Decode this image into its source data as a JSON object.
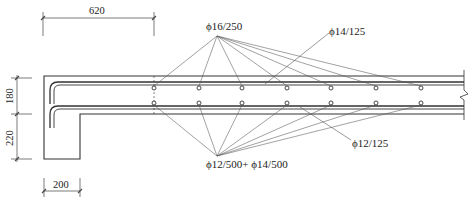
{
  "drawing": {
    "type": "reinforced-concrete-slab-section",
    "colors": {
      "line": "#333333",
      "leader": "#555555",
      "text": "#222222",
      "background": "#ffffff"
    }
  },
  "dimensions": {
    "top_width": "620",
    "top_thickness": "180",
    "step_height": "220",
    "bottom_width": "200"
  },
  "annotations": {
    "top_bars": "ϕ16/250",
    "top_distribution": "ϕ14/125",
    "bottom_bars": "ϕ12/500+ ϕ14/500",
    "bottom_distribution": "ϕ12/125"
  },
  "rebar_dots_x": [
    154,
    199,
    242,
    287,
    331,
    376,
    421
  ]
}
